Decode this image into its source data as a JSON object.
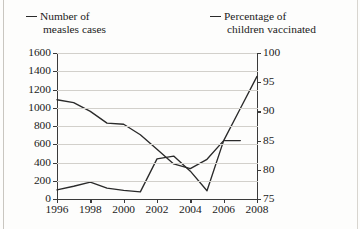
{
  "legend": {
    "series_left": {
      "line1": "Number of",
      "line2": "measles cases"
    },
    "series_right": {
      "line1": "Percentage of",
      "line2": "children vaccinated"
    }
  },
  "chart_data": {
    "type": "line",
    "title": "",
    "xlabel": "Year",
    "grid": true,
    "legend_position": "top",
    "x": [
      1996,
      1997,
      1998,
      1999,
      2000,
      2001,
      2002,
      2003,
      2004,
      2005,
      2006,
      2007,
      2008
    ],
    "xlim": [
      1996,
      2008
    ],
    "xticks": [
      1996,
      1998,
      2000,
      2002,
      2004,
      2006,
      2008
    ],
    "xticklabels": [
      "1996",
      "1998",
      "2000",
      "2002",
      "2004",
      "2006",
      "2008"
    ],
    "axes": [
      {
        "id": "left",
        "label": "Number of measles cases",
        "ylim": [
          0,
          1600
        ],
        "yticks": [
          0,
          200,
          400,
          600,
          800,
          1000,
          1200,
          1400,
          1600
        ],
        "yticklabels": [
          "0",
          "200",
          "400",
          "600",
          "800",
          "1000",
          "1200",
          "1400",
          "1600"
        ]
      },
      {
        "id": "right",
        "label": "Percentage of children vaccinated",
        "ylim": [
          75,
          100
        ],
        "yticks": [
          75,
          80,
          85,
          90,
          95,
          100
        ],
        "yticklabels": [
          "75",
          "80",
          "85",
          "90",
          "95",
          "100"
        ]
      }
    ],
    "series": [
      {
        "name": "Number of measles cases",
        "axis": "left",
        "units": "cases",
        "values": [
          100,
          140,
          185,
          120,
          95,
          78,
          440,
          470,
          305,
          90,
          640,
          640,
          null
        ]
      },
      {
        "name": "Percentage of children vaccinated",
        "axis": "right",
        "units": "percent",
        "values": [
          92.0,
          91.5,
          90.0,
          88.0,
          87.8,
          86.0,
          83.5,
          81.0,
          80.2,
          81.8,
          85.0,
          90.5,
          96.0
        ]
      }
    ]
  }
}
